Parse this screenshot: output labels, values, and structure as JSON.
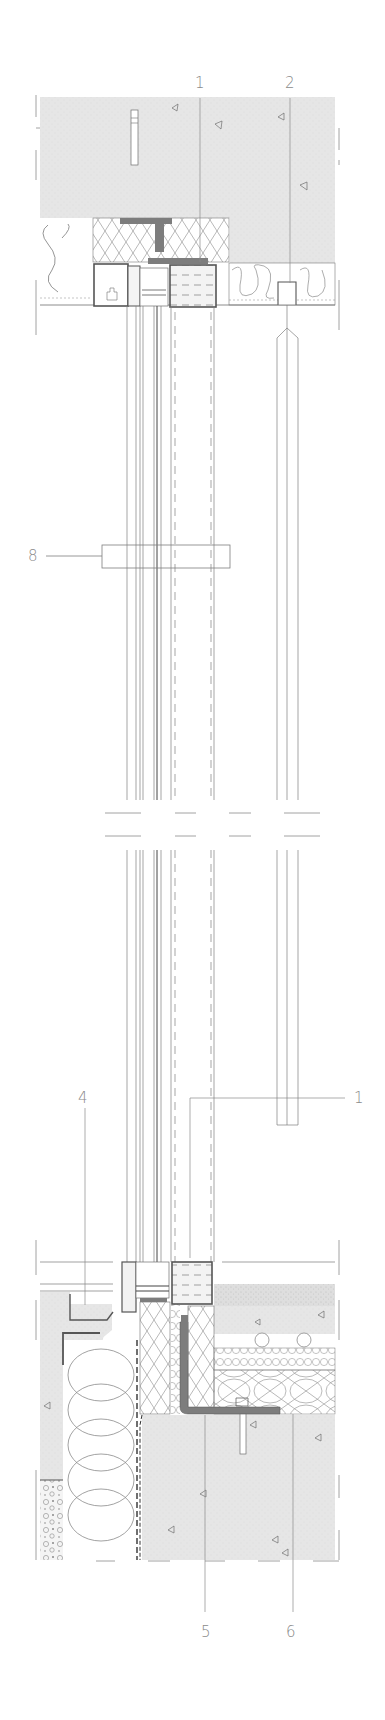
{
  "drawing": {
    "type": "architectural-section-detail",
    "subject": "curtain wall vertical section with floor slabs",
    "colors": {
      "line": "#6e6e6e",
      "dark_steel": "#7d7d7d",
      "concrete_fill": "#e6e6e6",
      "background": "#ffffff",
      "label": "#8a8a8a"
    }
  },
  "callouts": [
    {
      "id": "callout-1-top",
      "label": "1",
      "x": 195,
      "y": 76
    },
    {
      "id": "callout-2-top",
      "label": "2",
      "x": 285,
      "y": 76
    },
    {
      "id": "callout-8",
      "label": "8",
      "x": 28,
      "y": 552
    },
    {
      "id": "callout-4",
      "label": "4",
      "x": 78,
      "y": 1091
    },
    {
      "id": "callout-1-bottom",
      "label": "1",
      "x": 354,
      "y": 1091
    },
    {
      "id": "callout-5",
      "label": "5",
      "x": 201,
      "y": 1625
    },
    {
      "id": "callout-6",
      "label": "6",
      "x": 286,
      "y": 1625
    }
  ]
}
